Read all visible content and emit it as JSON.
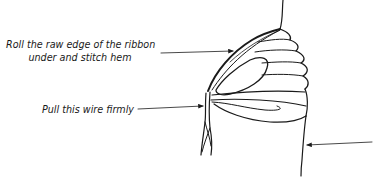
{
  "diagram": {
    "annotations": [
      {
        "id": "roll",
        "lines": [
          "Roll the raw edge of the ribbon",
          "under and stitch hem"
        ]
      },
      {
        "id": "pull",
        "lines": [
          "Pull this wire firmly"
        ]
      }
    ],
    "colors": {
      "ink": "#1a1a1a",
      "background": "#ffffff"
    }
  }
}
